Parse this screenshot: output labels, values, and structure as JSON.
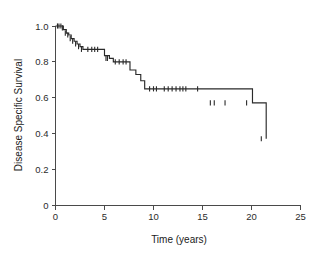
{
  "chart_data": {
    "type": "line",
    "subtype": "kaplan-meier-survival-curve",
    "title": "",
    "xlabel": "Time (years)",
    "ylabel": "Disease Specific Survival",
    "xlim": [
      0,
      25
    ],
    "ylim": [
      0,
      1.0
    ],
    "xticks": [
      0,
      5,
      10,
      15,
      20,
      25
    ],
    "xtick_labels": [
      "0",
      "5",
      "10",
      "15",
      "20",
      "25"
    ],
    "yticks": [
      0,
      0.2,
      0.4,
      0.6,
      0.8,
      1.0
    ],
    "ytick_labels": [
      "0",
      "0.2",
      "0.4",
      "0.6",
      "0.8",
      "1.0"
    ],
    "grid": false,
    "legend": false,
    "series": [
      {
        "name": "Disease Specific Survival",
        "color": "#2a2a2a",
        "step": "post",
        "x": [
          0.0,
          0.45,
          0.8,
          1.1,
          1.35,
          1.6,
          1.9,
          2.2,
          2.5,
          2.8,
          3.1,
          4.6,
          5.0,
          5.5,
          5.9,
          7.4,
          7.6,
          8.2,
          8.7,
          9.1,
          15.3,
          20.1,
          21.5
        ],
        "y": [
          1.0,
          1.0,
          0.98,
          0.96,
          0.95,
          0.93,
          0.915,
          0.9,
          0.885,
          0.87,
          0.87,
          0.87,
          0.835,
          0.82,
          0.8,
          0.8,
          0.755,
          0.73,
          0.695,
          0.65,
          0.65,
          0.572,
          0.372
        ],
        "censor_x": [
          0.2,
          0.35,
          0.55,
          0.7,
          1.0,
          1.25,
          1.5,
          1.75,
          2.05,
          2.35,
          2.65,
          3.3,
          3.7,
          4.0,
          4.3,
          5.15,
          5.3,
          6.1,
          6.5,
          6.9,
          7.2,
          9.6,
          10.0,
          10.3,
          11.1,
          11.5,
          11.9,
          12.3,
          12.7,
          13.0,
          13.3,
          14.5,
          15.8,
          16.2,
          17.3,
          19.5,
          21.0
        ],
        "censor_y": [
          1.0,
          1.0,
          1.0,
          0.99,
          0.96,
          0.95,
          0.93,
          0.915,
          0.9,
          0.885,
          0.87,
          0.87,
          0.87,
          0.87,
          0.87,
          0.82,
          0.82,
          0.8,
          0.8,
          0.8,
          0.8,
          0.65,
          0.65,
          0.65,
          0.65,
          0.65,
          0.65,
          0.65,
          0.65,
          0.65,
          0.65,
          0.65,
          0.572,
          0.572,
          0.572,
          0.572,
          0.372
        ]
      }
    ],
    "annotations": []
  },
  "colors": {
    "curve": "#2a2a2a",
    "axis": "#4a4a4a",
    "background": "#ffffff",
    "text": "#1a1a1a"
  }
}
